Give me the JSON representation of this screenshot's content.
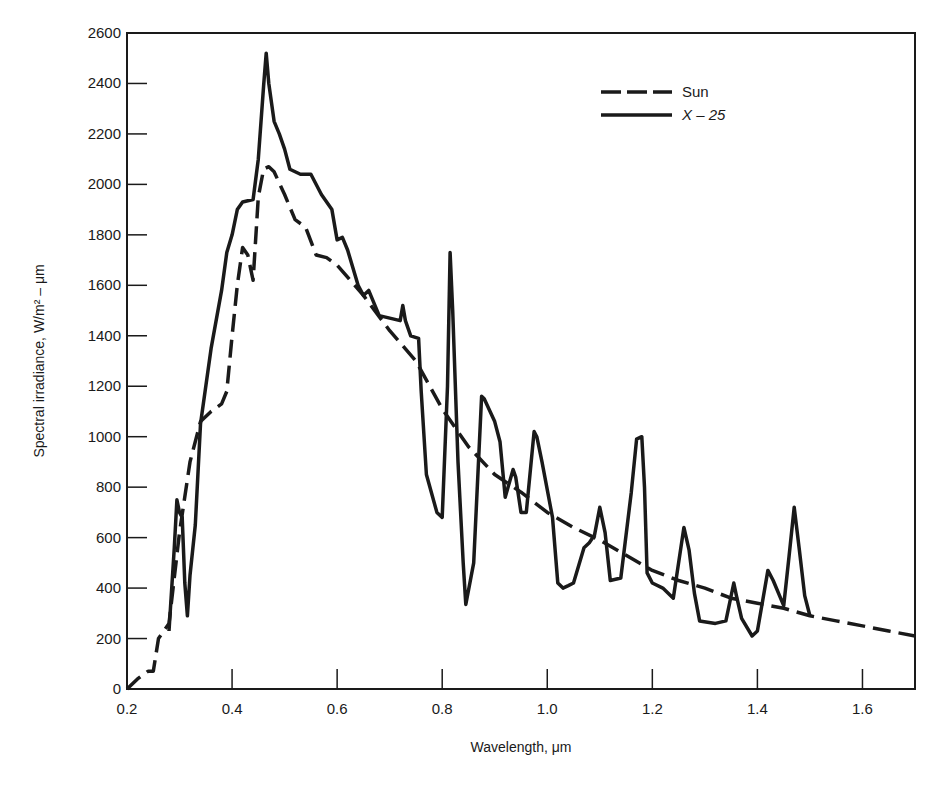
{
  "chart_data": {
    "type": "line",
    "title": "",
    "xlabel": "Wavelength,  μm",
    "ylabel": "Spectral irradiance, W/m² – μm",
    "xlim": [
      0.2,
      1.7
    ],
    "ylim": [
      0,
      2600
    ],
    "grid": false,
    "legend_position": "upper right",
    "x_ticks": [
      0.2,
      0.4,
      0.6,
      0.8,
      1.0,
      1.2,
      1.4,
      1.6
    ],
    "x_tick_labels": [
      "0.2",
      "0.4",
      "0.6",
      "0.8",
      "1.0",
      "1.2",
      "1.4",
      "1.6"
    ],
    "y_ticks": [
      0,
      200,
      400,
      600,
      800,
      1000,
      1200,
      1400,
      1600,
      1800,
      2000,
      2200,
      2400,
      2600
    ],
    "y_tick_labels": [
      "0",
      "200",
      "400",
      "600",
      "800",
      "1000",
      "1200",
      "1400",
      "1600",
      "1800",
      "2000",
      "2200",
      "2400",
      "2600"
    ],
    "series": [
      {
        "name": "Sun",
        "style": "dashed",
        "points": [
          [
            0.2,
            0
          ],
          [
            0.22,
            40
          ],
          [
            0.24,
            70
          ],
          [
            0.25,
            70
          ],
          [
            0.26,
            200
          ],
          [
            0.28,
            260
          ],
          [
            0.3,
            620
          ],
          [
            0.32,
            900
          ],
          [
            0.34,
            1060
          ],
          [
            0.36,
            1100
          ],
          [
            0.38,
            1130
          ],
          [
            0.39,
            1180
          ],
          [
            0.4,
            1400
          ],
          [
            0.41,
            1600
          ],
          [
            0.42,
            1750
          ],
          [
            0.43,
            1720
          ],
          [
            0.44,
            1620
          ],
          [
            0.45,
            1950
          ],
          [
            0.46,
            2060
          ],
          [
            0.47,
            2070
          ],
          [
            0.48,
            2050
          ],
          [
            0.5,
            1960
          ],
          [
            0.52,
            1860
          ],
          [
            0.54,
            1830
          ],
          [
            0.56,
            1720
          ],
          [
            0.58,
            1710
          ],
          [
            0.6,
            1680
          ],
          [
            0.65,
            1560
          ],
          [
            0.7,
            1420
          ],
          [
            0.75,
            1300
          ],
          [
            0.8,
            1110
          ],
          [
            0.85,
            960
          ],
          [
            0.9,
            850
          ],
          [
            0.95,
            780
          ],
          [
            1.0,
            700
          ],
          [
            1.05,
            640
          ],
          [
            1.1,
            590
          ],
          [
            1.15,
            530
          ],
          [
            1.2,
            470
          ],
          [
            1.25,
            430
          ],
          [
            1.3,
            400
          ],
          [
            1.35,
            360
          ],
          [
            1.4,
            340
          ],
          [
            1.45,
            320
          ],
          [
            1.5,
            290
          ],
          [
            1.55,
            270
          ],
          [
            1.6,
            250
          ],
          [
            1.65,
            230
          ],
          [
            1.7,
            210
          ]
        ]
      },
      {
        "name": "X – 25",
        "style": "solid",
        "points": [
          [
            0.28,
            230
          ],
          [
            0.29,
            560
          ],
          [
            0.295,
            750
          ],
          [
            0.3,
            700
          ],
          [
            0.305,
            680
          ],
          [
            0.31,
            420
          ],
          [
            0.315,
            290
          ],
          [
            0.32,
            450
          ],
          [
            0.33,
            650
          ],
          [
            0.34,
            1050
          ],
          [
            0.36,
            1350
          ],
          [
            0.38,
            1580
          ],
          [
            0.39,
            1730
          ],
          [
            0.4,
            1800
          ],
          [
            0.41,
            1900
          ],
          [
            0.42,
            1930
          ],
          [
            0.44,
            1940
          ],
          [
            0.45,
            2100
          ],
          [
            0.46,
            2390
          ],
          [
            0.465,
            2520
          ],
          [
            0.47,
            2400
          ],
          [
            0.48,
            2250
          ],
          [
            0.49,
            2200
          ],
          [
            0.5,
            2140
          ],
          [
            0.51,
            2060
          ],
          [
            0.53,
            2040
          ],
          [
            0.55,
            2040
          ],
          [
            0.57,
            1960
          ],
          [
            0.59,
            1900
          ],
          [
            0.6,
            1780
          ],
          [
            0.61,
            1790
          ],
          [
            0.62,
            1740
          ],
          [
            0.64,
            1600
          ],
          [
            0.65,
            1560
          ],
          [
            0.66,
            1580
          ],
          [
            0.68,
            1480
          ],
          [
            0.7,
            1470
          ],
          [
            0.72,
            1460
          ],
          [
            0.725,
            1520
          ],
          [
            0.73,
            1460
          ],
          [
            0.74,
            1400
          ],
          [
            0.755,
            1390
          ],
          [
            0.76,
            1180
          ],
          [
            0.77,
            850
          ],
          [
            0.79,
            700
          ],
          [
            0.8,
            680
          ],
          [
            0.81,
            1200
          ],
          [
            0.815,
            1730
          ],
          [
            0.82,
            1500
          ],
          [
            0.83,
            900
          ],
          [
            0.84,
            500
          ],
          [
            0.845,
            335
          ],
          [
            0.86,
            500
          ],
          [
            0.875,
            1160
          ],
          [
            0.88,
            1150
          ],
          [
            0.9,
            1060
          ],
          [
            0.91,
            980
          ],
          [
            0.92,
            760
          ],
          [
            0.935,
            870
          ],
          [
            0.94,
            840
          ],
          [
            0.95,
            700
          ],
          [
            0.96,
            700
          ],
          [
            0.975,
            1020
          ],
          [
            0.98,
            1000
          ],
          [
            0.99,
            900
          ],
          [
            1.01,
            680
          ],
          [
            1.02,
            420
          ],
          [
            1.03,
            400
          ],
          [
            1.04,
            410
          ],
          [
            1.05,
            420
          ],
          [
            1.07,
            560
          ],
          [
            1.08,
            580
          ],
          [
            1.09,
            610
          ],
          [
            1.1,
            720
          ],
          [
            1.11,
            620
          ],
          [
            1.12,
            430
          ],
          [
            1.14,
            440
          ],
          [
            1.16,
            780
          ],
          [
            1.17,
            990
          ],
          [
            1.18,
            1000
          ],
          [
            1.185,
            800
          ],
          [
            1.19,
            460
          ],
          [
            1.2,
            420
          ],
          [
            1.22,
            400
          ],
          [
            1.24,
            360
          ],
          [
            1.26,
            640
          ],
          [
            1.27,
            550
          ],
          [
            1.28,
            380
          ],
          [
            1.29,
            270
          ],
          [
            1.32,
            260
          ],
          [
            1.34,
            270
          ],
          [
            1.355,
            420
          ],
          [
            1.36,
            370
          ],
          [
            1.37,
            280
          ],
          [
            1.39,
            210
          ],
          [
            1.4,
            230
          ],
          [
            1.42,
            470
          ],
          [
            1.43,
            430
          ],
          [
            1.45,
            330
          ],
          [
            1.46,
            520
          ],
          [
            1.47,
            720
          ],
          [
            1.48,
            550
          ],
          [
            1.49,
            370
          ],
          [
            1.5,
            290
          ]
        ]
      }
    ]
  },
  "legend": {
    "items": [
      {
        "label": "Sun",
        "style": "dashed"
      },
      {
        "label": "X – 25",
        "style": "solid"
      }
    ]
  },
  "colors": {
    "line": "#1a1a1a",
    "background": "#ffffff"
  }
}
